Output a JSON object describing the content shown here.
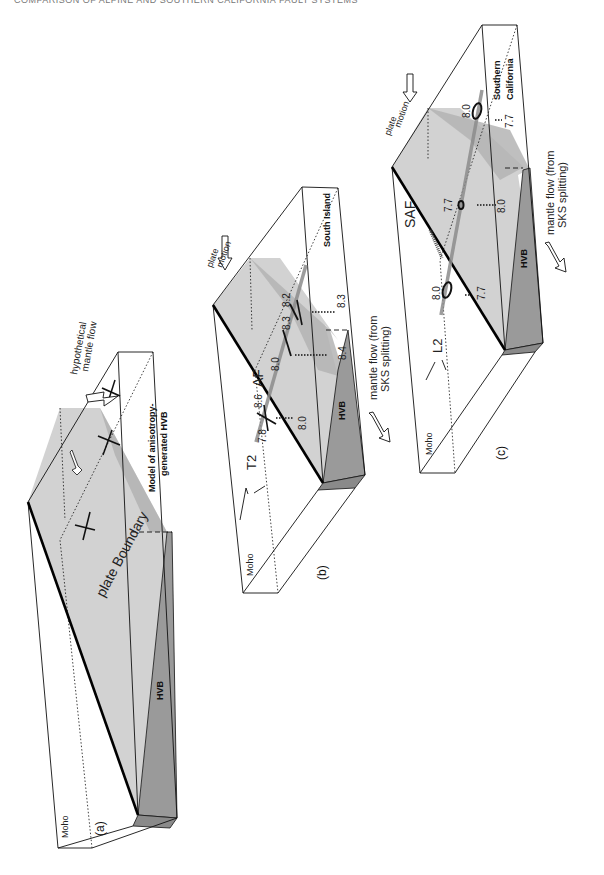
{
  "running_head": "COMPARISON OF ALPINE AND SOUTHERN CALIFORNIA FAULT SYSTEMS",
  "colors": {
    "top_face": "#d2d2d2",
    "hvb_face": "#9a9a9a",
    "hvb_dark": "#8a8a8a",
    "shadow": "#b4b4b4",
    "fault_trace": "#8c8c8c",
    "line": "#111111"
  },
  "panels": {
    "a": {
      "label": "(a)",
      "moho": "Moho",
      "plate_boundary": "plate Boundary",
      "hvb": "HVB",
      "model_line1": "Model of anisotropy-",
      "model_line2": "generated HVB",
      "flow_line1": "hypothetical",
      "flow_line2": "mantle flow"
    },
    "b": {
      "label": "(b)",
      "moho": "Moho",
      "fault": "AF",
      "fault2": "T2",
      "hvb": "HVB",
      "region": "South Island",
      "plate_motion_line1": "plate",
      "plate_motion_line2": "motion",
      "mantle_flow_line1": "mantle flow (from",
      "mantle_flow_line2": "SKS splitting)",
      "values": {
        "v78": "7.8",
        "v86": "8.6",
        "v80a": "8.0",
        "v80b": "8.0",
        "v83a": "8.3",
        "v82": "8.2",
        "v84": "8.4",
        "v83b": "8.3"
      }
    },
    "c": {
      "label": "(c)",
      "moho": "Moho",
      "fault": "SAF",
      "fault2": "L2",
      "hvb": "HVB",
      "region_line1": "Southern",
      "region_line2": "California",
      "plate_motion_line1": "plate",
      "plate_motion_line2": "motion",
      "mantle_flow_line1": "mantle flow (from",
      "mantle_flow_line2": "SKS splitting)",
      "values": {
        "v80a": "8.0",
        "v77a": "7.7",
        "v77b": "7.7",
        "v80b": "8.0",
        "v80c": "8.0",
        "v77c": "7.7"
      }
    }
  }
}
